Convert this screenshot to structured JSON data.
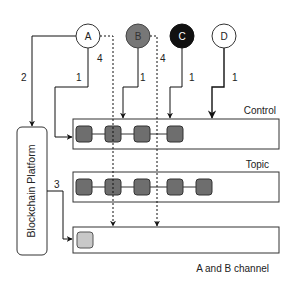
{
  "nodes": [
    {
      "id": "A",
      "label": "A",
      "fill": "#ffffff",
      "text_color": "#222222"
    },
    {
      "id": "B",
      "label": "B",
      "fill": "#777777",
      "text_color": "#333333"
    },
    {
      "id": "C",
      "label": "C",
      "fill": "#111111",
      "text_color": "#ffffff"
    },
    {
      "id": "D",
      "label": "D",
      "fill": "#ffffff",
      "text_color": "#222222"
    }
  ],
  "platform": {
    "label": "Blockchain Platform"
  },
  "channels": [
    {
      "name": "control",
      "label": "Control",
      "blocks": 4
    },
    {
      "name": "topic",
      "label": "Topic",
      "blocks": 5
    },
    {
      "name": "ab-channel",
      "label": "A and B channel",
      "blocks": 1
    }
  ],
  "edge_labels": {
    "a_to_platform": "2",
    "a_to_control": "1",
    "a_dashed": "4",
    "b_to_control": "1",
    "b_dashed": "4",
    "c_to_control": "1",
    "d_to_control": "1",
    "platform_to_ab": "3"
  },
  "colors": {
    "block_dark": "#6e6e6e",
    "block_light": "#c8c8c8",
    "line": "#222222"
  }
}
